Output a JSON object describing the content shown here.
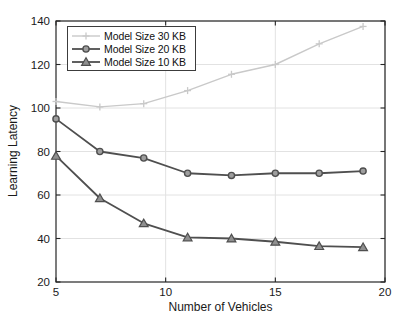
{
  "chart_data": {
    "type": "line",
    "title": "",
    "xlabel": "Number of Vehicles",
    "ylabel": "Learning Latency",
    "x": [
      5,
      7,
      9,
      11,
      13,
      15,
      17,
      19
    ],
    "xlim": [
      5,
      20
    ],
    "ylim": [
      20,
      140
    ],
    "xticks": [
      5,
      10,
      15,
      20
    ],
    "yticks": [
      20,
      40,
      60,
      80,
      100,
      120,
      140
    ],
    "grid": true,
    "legend_position": "top-left-inside",
    "series": [
      {
        "name": "Model Size 30 KB",
        "marker": "plus",
        "color": "#c9c9c9",
        "marker_fill": "#c9c9c9",
        "line_width": 1.4,
        "values": [
          103,
          100.5,
          102,
          108,
          115.5,
          120,
          129.5,
          137.5
        ]
      },
      {
        "name": "Model Size 20 KB",
        "marker": "circle",
        "color": "#4f4f4f",
        "marker_fill": "#9e9e9e",
        "line_width": 1.8,
        "values": [
          95,
          80,
          77,
          70,
          69,
          70,
          70,
          71
        ]
      },
      {
        "name": "Model Size 10 KB",
        "marker": "triangle",
        "color": "#4f4f4f",
        "marker_fill": "#8f8f8f",
        "line_width": 1.8,
        "values": [
          78,
          58.5,
          47,
          40.5,
          40,
          38.5,
          36.5,
          36
        ]
      }
    ]
  },
  "colors": {
    "background": "#ffffff",
    "axis": "#262626",
    "grid": "#e2e2e2",
    "tick_label": "#1a1a1a"
  }
}
